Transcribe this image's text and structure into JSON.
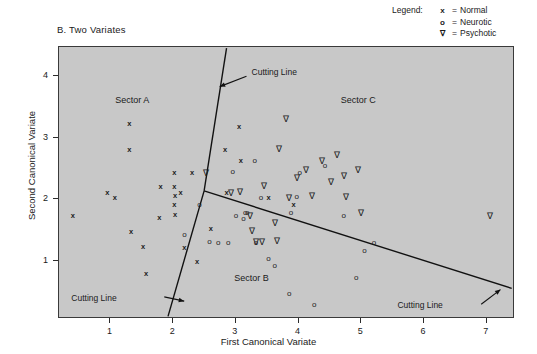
{
  "panel": {
    "title": "B. Two Variates"
  },
  "legend": {
    "title": "Legend:",
    "entries": [
      {
        "symbol": "x",
        "eq": "=",
        "label": "Normal"
      },
      {
        "symbol": "o",
        "eq": "=",
        "label": "Neurotic"
      },
      {
        "symbol": "∇",
        "eq": "=",
        "label": "Psychotic"
      }
    ]
  },
  "annotations": {
    "sectors": [
      {
        "text": "Sector A",
        "x": 1.35,
        "y": 3.62
      },
      {
        "text": "Sector B",
        "x": 3.25,
        "y": 0.72
      },
      {
        "text": "Sector C",
        "x": 4.95,
        "y": 3.62
      }
    ],
    "cutting_lines": [
      {
        "text": "Cutting Line",
        "x": 3.25,
        "y": 4.05
      },
      {
        "text": "Cutting Line",
        "x": 1.1,
        "y": 0.38
      },
      {
        "text": "Cutting Line",
        "x": 6.3,
        "y": 0.26
      }
    ]
  },
  "chart_data": {
    "type": "scatter",
    "title": "B. Two Variates",
    "xlabel": "First Canonical Variate",
    "ylabel": "Second Canonical Variate",
    "xlim": [
      0.18,
      7.45
    ],
    "ylim": [
      0.05,
      4.48
    ],
    "xticks": [
      1,
      2,
      3,
      4,
      5,
      6,
      7
    ],
    "yticks": [
      1,
      2,
      3,
      4
    ],
    "grid": false,
    "legend_position": "above-right",
    "background": "#c8c8c8",
    "series": [
      {
        "name": "Normal",
        "marker": "x",
        "points": [
          [
            0.4,
            1.72
          ],
          [
            0.95,
            2.1
          ],
          [
            1.07,
            2.02
          ],
          [
            1.3,
            3.22
          ],
          [
            1.3,
            2.8
          ],
          [
            1.33,
            1.47
          ],
          [
            1.52,
            1.22
          ],
          [
            1.57,
            0.78
          ],
          [
            1.78,
            1.7
          ],
          [
            1.8,
            2.2
          ],
          [
            2.02,
            2.42
          ],
          [
            2.02,
            2.2
          ],
          [
            2.03,
            2.05
          ],
          [
            2.02,
            1.9
          ],
          [
            2.03,
            1.75
          ],
          [
            2.12,
            2.1
          ],
          [
            2.18,
            1.2
          ],
          [
            2.3,
            2.42
          ],
          [
            2.38,
            0.98
          ],
          [
            2.6,
            1.52
          ],
          [
            2.83,
            2.8
          ],
          [
            2.85,
            2.1
          ],
          [
            3.05,
            3.18
          ],
          [
            3.08,
            2.63
          ],
          [
            3.52,
            2.02
          ],
          [
            3.92,
            1.9
          ]
        ]
      },
      {
        "name": "Neurotic",
        "marker": "o",
        "points": [
          [
            2.18,
            1.42
          ],
          [
            2.42,
            1.9
          ],
          [
            2.58,
            1.3
          ],
          [
            2.72,
            1.28
          ],
          [
            2.88,
            1.28
          ],
          [
            2.95,
            2.45
          ],
          [
            3.0,
            1.72
          ],
          [
            3.12,
            1.68
          ],
          [
            3.15,
            1.78
          ],
          [
            3.18,
            1.78
          ],
          [
            3.3,
            2.62
          ],
          [
            3.32,
            1.28
          ],
          [
            3.4,
            2.02
          ],
          [
            3.52,
            1.02
          ],
          [
            3.62,
            0.92
          ],
          [
            3.85,
            0.45
          ],
          [
            3.88,
            1.78
          ],
          [
            3.97,
            2.03
          ],
          [
            4.02,
            2.42
          ],
          [
            4.25,
            0.28
          ],
          [
            4.42,
            2.55
          ],
          [
            4.72,
            1.72
          ],
          [
            4.92,
            0.72
          ],
          [
            5.05,
            1.15
          ],
          [
            5.2,
            1.28
          ]
        ]
      },
      {
        "name": "Psychotic",
        "marker": "∇",
        "points": [
          [
            2.52,
            2.42
          ],
          [
            2.92,
            2.1
          ],
          [
            3.07,
            2.12
          ],
          [
            3.22,
            1.72
          ],
          [
            3.25,
            1.48
          ],
          [
            3.32,
            1.3
          ],
          [
            3.42,
            1.3
          ],
          [
            3.45,
            2.22
          ],
          [
            3.62,
            1.62
          ],
          [
            3.65,
            1.32
          ],
          [
            3.68,
            2.82
          ],
          [
            3.8,
            3.3
          ],
          [
            3.85,
            2.02
          ],
          [
            3.98,
            2.35
          ],
          [
            4.12,
            2.47
          ],
          [
            4.22,
            2.05
          ],
          [
            4.38,
            2.62
          ],
          [
            4.52,
            2.28
          ],
          [
            4.62,
            2.72
          ],
          [
            4.72,
            2.38
          ],
          [
            4.75,
            2.03
          ],
          [
            4.95,
            2.48
          ],
          [
            5.0,
            1.78
          ],
          [
            7.05,
            1.72
          ]
        ]
      }
    ],
    "cutting_lines": {
      "vertex": [
        2.5,
        2.12
      ],
      "segments": [
        {
          "from": [
            2.5,
            2.12
          ],
          "to": [
            2.86,
            4.46
          ],
          "label": "Cutting Line"
        },
        {
          "from": [
            2.5,
            2.12
          ],
          "to": [
            1.92,
            0.06
          ],
          "label": "Cutting Line"
        },
        {
          "from": [
            2.5,
            2.12
          ],
          "to": [
            7.44,
            0.52
          ],
          "label": "Cutting Line"
        }
      ]
    }
  }
}
